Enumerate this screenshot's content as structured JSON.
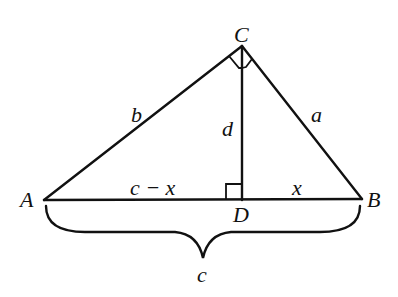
{
  "diagram": {
    "title": "",
    "type": "right triangle with altitude to hypotenuse",
    "colors": {
      "stroke": "#111111",
      "background": "#ffffff"
    },
    "vertices": {
      "A": {
        "label": "A",
        "x": 44,
        "y": 200
      },
      "B": {
        "label": "B",
        "x": 362,
        "y": 199
      },
      "C": {
        "label": "C",
        "x": 242,
        "y": 46
      },
      "D": {
        "label": "D",
        "x": 242,
        "y": 200
      }
    },
    "sides": {
      "b": {
        "label": "b",
        "from": "A",
        "to": "C"
      },
      "a": {
        "label": "a",
        "from": "C",
        "to": "B"
      },
      "d": {
        "label": "d",
        "from": "C",
        "to": "D"
      },
      "c_minus_x": {
        "label": "c − x",
        "from": "A",
        "to": "D"
      },
      "x": {
        "label": "x",
        "from": "D",
        "to": "B"
      },
      "c": {
        "label": "c",
        "from": "A",
        "to": "B",
        "style": "brace"
      }
    },
    "right_angles": [
      "C (between CA and CD)",
      "C (between CD and CB)",
      "D"
    ]
  }
}
